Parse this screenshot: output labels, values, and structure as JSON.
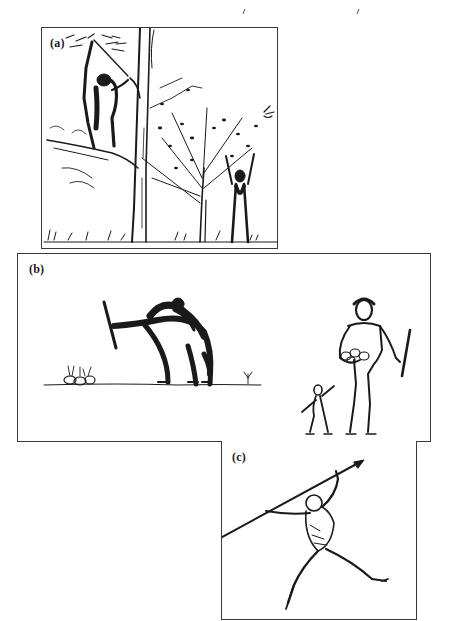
{
  "page": {
    "running_head_marks": [
      ",",
      ","
    ]
  },
  "figure": {
    "panels": [
      {
        "id": "a",
        "label": "(a)",
        "description": "Ape in tree using a stick; tall trunk; small leafy tree; upright human reaching up into branches; grass tufts along ground"
      },
      {
        "id": "b",
        "label": "(b)",
        "description": "Hunched ape carrying young on back, holding digging stick near a cluster of tubers on ground line; upright human holding stick and cradling tubers with child beside"
      },
      {
        "id": "c",
        "label": "(c)",
        "description": "Human figure in throwing pose launching a long spear diagonally upward"
      }
    ]
  },
  "colors": {
    "ink": "#1a1a1a",
    "border": "#3a3a3a",
    "paper": "#ffffff"
  }
}
